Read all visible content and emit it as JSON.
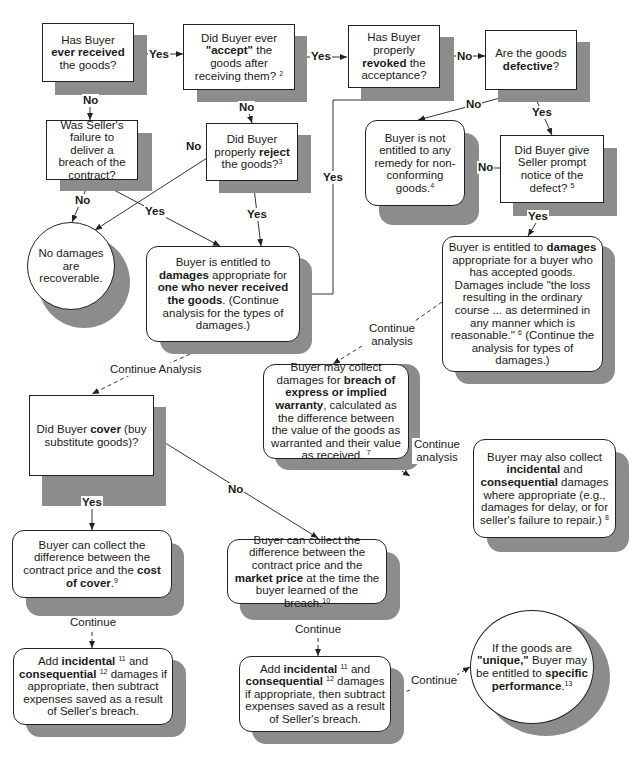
{
  "nodes": {
    "n1": {
      "parts": [
        [
          "Has Buyer ",
          false
        ],
        [
          "ever received",
          true
        ],
        [
          " the goods?",
          false
        ]
      ]
    },
    "n2": {
      "parts": [
        [
          "Did Buyer ever ",
          false
        ],
        [
          "\"accept\"",
          true
        ],
        [
          " the goods after receiving them? ",
          false
        ]
      ],
      "sup": "2"
    },
    "n3": {
      "parts": [
        [
          "Has Buyer properly ",
          false
        ],
        [
          "revoked",
          true
        ],
        [
          " the acceptance?",
          false
        ]
      ]
    },
    "n4": {
      "parts": [
        [
          "Are the goods ",
          false
        ],
        [
          "defective",
          true
        ],
        [
          "?",
          false
        ]
      ]
    },
    "n5": {
      "parts": [
        [
          "Was Seller's failure to deliver a breach of the contract?",
          false
        ]
      ]
    },
    "n6": {
      "parts": [
        [
          "Did Buyer properly ",
          false
        ],
        [
          "reject",
          true
        ],
        [
          " the goods?",
          false
        ]
      ],
      "sup": "3"
    },
    "n7": {
      "parts": [
        [
          "Buyer is not entitled to any remedy for non-conforming goods.",
          false
        ]
      ],
      "sup": "4"
    },
    "n8": {
      "parts": [
        [
          "Did Buyer give Seller prompt notice of the defect? ",
          false
        ]
      ],
      "sup": "5"
    },
    "n9": {
      "parts": [
        [
          "No damages are recoverable.",
          false
        ]
      ]
    },
    "n10": {
      "parts": [
        [
          "Buyer is entitled to ",
          false
        ],
        [
          "damages",
          true
        ],
        [
          " appropriate for ",
          false
        ],
        [
          "one who never received the goods",
          true
        ],
        [
          ".  (Continue analysis for the types of damages.)",
          false
        ]
      ]
    },
    "n11": {
      "parts": [
        [
          "Buyer is entitled to ",
          false
        ],
        [
          "damages",
          true
        ],
        [
          " appropriate for a buyer who has accepted goods. Damages include \"the loss resulting in the ordinary course ... as determined in any manner which is reasonable.\" ",
          false
        ]
      ],
      "sup": "6",
      "tail": " (Continue the analysis for types of damages.)"
    },
    "n12": {
      "parts": [
        [
          "Buyer may collect damages for ",
          false
        ],
        [
          "breach of express or implied warranty",
          true
        ],
        [
          ", calculated as the difference between the value of the goods as warranted and their value as received. ",
          false
        ]
      ],
      "sup": "7"
    },
    "n13": {
      "parts": [
        [
          "Did Buyer ",
          false
        ],
        [
          "cover",
          true
        ],
        [
          " (buy substitute goods)?",
          false
        ]
      ]
    },
    "n14": {
      "parts": [
        [
          "Buyer may also collect ",
          false
        ],
        [
          "incidental",
          true
        ],
        [
          " and ",
          false
        ],
        [
          "consequential",
          true
        ],
        [
          " damages where appropriate (e.g., damages for delay, or for seller's failure to repair.) ",
          false
        ]
      ],
      "sup": "8"
    },
    "n15": {
      "parts": [
        [
          "Buyer can collect the difference between the contract price and the ",
          false
        ],
        [
          "cost of cover",
          true
        ],
        [
          ".",
          false
        ]
      ],
      "sup": "9"
    },
    "n16": {
      "parts": [
        [
          "Buyer can collect the difference between the contract price and the ",
          false
        ],
        [
          "market price",
          true
        ],
        [
          " at the time the buyer learned of the breach.",
          false
        ]
      ],
      "sup": "10"
    },
    "n17": {
      "parts": [
        [
          "Add ",
          false
        ],
        [
          "incidental",
          true
        ],
        [
          " ",
          false
        ],
        [
          "{11}",
          false
        ],
        [
          " and ",
          false
        ],
        [
          "consequential",
          true
        ],
        [
          " ",
          false
        ],
        [
          "{12}",
          false
        ],
        [
          " damages if appropriate, then subtract expenses saved as a result of Seller's breach.",
          false
        ]
      ]
    },
    "n18": {
      "parts": [
        [
          "Add ",
          false
        ],
        [
          "incidental",
          true
        ],
        [
          " ",
          false
        ],
        [
          "{11}",
          false
        ],
        [
          " and ",
          false
        ],
        [
          "consequential",
          true
        ],
        [
          " ",
          false
        ],
        [
          "{12}",
          false
        ],
        [
          " damages if appropriate, then subtract expenses saved as a result of Seller's breach.",
          false
        ]
      ]
    },
    "n19": {
      "parts": [
        [
          "If the goods are ",
          false
        ],
        [
          "\"unique,\"",
          true
        ],
        [
          " Buyer may be entitled to ",
          false
        ],
        [
          "specific performance",
          true
        ],
        [
          ".",
          false
        ]
      ],
      "sup": "13"
    }
  },
  "labels": {
    "yes": "Yes",
    "no": "No",
    "continue": "Continue",
    "continue_analysis_cap": "Continue Analysis",
    "continue_analysis": "Continue analysis"
  }
}
